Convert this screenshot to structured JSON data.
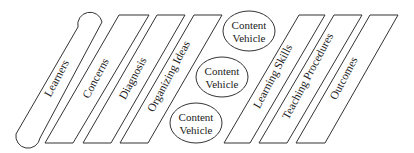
{
  "diagram": {
    "stages": [
      {
        "id": "learners",
        "label": "Learners",
        "shape": "rounded-parallelogram"
      },
      {
        "id": "concerns",
        "label": "Concerns",
        "shape": "parallelogram"
      },
      {
        "id": "diagnosis",
        "label": "Diagnosis",
        "shape": "parallelogram"
      },
      {
        "id": "organizing-ideas",
        "label": "Organizing Ideas",
        "shape": "parallelogram"
      },
      {
        "id": "learning-skills",
        "label": "Learning Skills",
        "shape": "parallelogram"
      },
      {
        "id": "teaching-procedures",
        "label": "Teaching Procedures",
        "shape": "parallelogram"
      },
      {
        "id": "outcomes",
        "label": "Outcomes",
        "shape": "parallelogram"
      }
    ],
    "content_vehicles": [
      {
        "line1": "Content",
        "line2": "Vehicle"
      },
      {
        "line1": "Content",
        "line2": "Vehicle"
      },
      {
        "line1": "Content",
        "line2": "Vehicle"
      }
    ],
    "colors": {
      "stroke": "#333333",
      "text": "#222222",
      "background": "#ffffff"
    }
  }
}
